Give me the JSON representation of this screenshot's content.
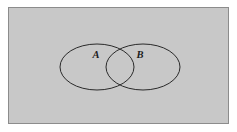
{
  "figure": {
    "type": "venn-diagram",
    "canvas": {
      "width": 237,
      "height": 132,
      "background": "#ffffff"
    },
    "universe": {
      "name": "universal-set-rectangle",
      "x": 8.5,
      "y": 7.5,
      "width": 220,
      "height": 116,
      "fill": "#c8c8c8",
      "stroke": "#8c8c8c",
      "stroke_width": 1
    },
    "sets": [
      {
        "id": "A",
        "label": "A",
        "shape": "ellipse",
        "cx": 97,
        "cy": 67,
        "rx": 37,
        "ry": 23,
        "fill": "none",
        "stroke": "#2a2a2a",
        "stroke_width": 1,
        "label_x": 96,
        "label_y": 58
      },
      {
        "id": "B",
        "label": "B",
        "shape": "ellipse",
        "cx": 143,
        "cy": 67,
        "rx": 37,
        "ry": 23,
        "fill": "none",
        "stroke": "#2a2a2a",
        "stroke_width": 1,
        "label_x": 140,
        "label_y": 58
      }
    ],
    "intersection": {
      "name": "intersection-region",
      "upper_crossing": {
        "x": 120,
        "y": 47
      },
      "lower_crossing": {
        "x": 120,
        "y": 87
      },
      "fill": "none"
    }
  }
}
